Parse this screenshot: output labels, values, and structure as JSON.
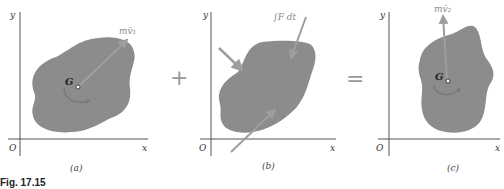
{
  "figure": {
    "caption": "Fig. 17.15",
    "operators": {
      "plus": "+",
      "equals": "="
    },
    "colors": {
      "body": "#8c8c8c",
      "arrow": "#9e9e9e",
      "axis": "#555555",
      "label_gray": "#8a8a8a",
      "text": "#333333"
    },
    "panels": [
      {
        "id": "a",
        "label": "(a)",
        "axes": {
          "x": "x",
          "y": "y",
          "origin": "O"
        },
        "centroid": "G",
        "momentum_label": "mv̄₁",
        "angular_label": "Īω₁"
      },
      {
        "id": "b",
        "label": "(b)",
        "axes": {
          "x": "x",
          "y": "y",
          "origin": "O"
        },
        "impulse_label": "∫F dt"
      },
      {
        "id": "c",
        "label": "(c)",
        "axes": {
          "x": "x",
          "y": "y",
          "origin": "O"
        },
        "centroid": "G",
        "momentum_label": "mv̄₂",
        "angular_label": "Īω₂"
      }
    ]
  }
}
